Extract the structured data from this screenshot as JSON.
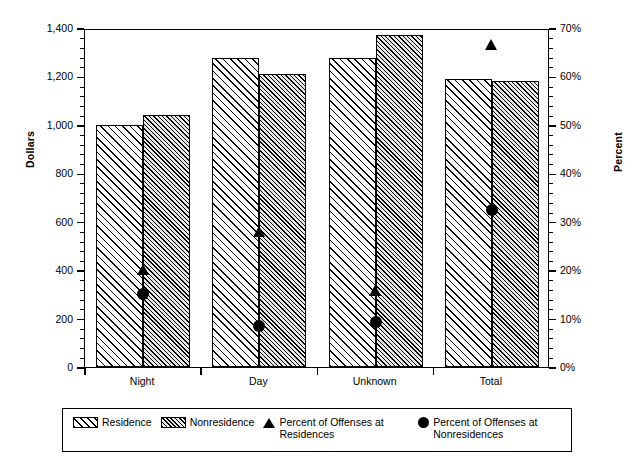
{
  "chart_data": {
    "type": "bar",
    "title": "",
    "subtitle": "",
    "xlabel": "",
    "ylabel": "Dollars",
    "y2label": "Percent",
    "categories": [
      "Night",
      "Day",
      "Unknown",
      "Total"
    ],
    "ylim": [
      0,
      1400
    ],
    "y2lim": [
      0,
      70
    ],
    "yticks": [
      0,
      200,
      400,
      600,
      800,
      1000,
      1200,
      1400
    ],
    "ytick_labels": [
      "0",
      "200",
      "400",
      "600",
      "800",
      "1,000",
      "1,200",
      "1,400"
    ],
    "y2ticks": [
      0,
      10,
      20,
      30,
      40,
      50,
      60,
      70
    ],
    "y2tick_labels": [
      "0%",
      "10%",
      "20%",
      "30%",
      "40%",
      "50%",
      "60%",
      "70%"
    ],
    "grid": false,
    "legend_position": "bottom",
    "series": [
      {
        "name": "Residence",
        "type": "bar",
        "axis": "left",
        "unit": "dollars",
        "fill": "diagonal-hatch-wide",
        "values": [
          1000,
          1275,
          1275,
          1190
        ]
      },
      {
        "name": "Nonresidence",
        "type": "bar",
        "axis": "left",
        "unit": "dollars",
        "fill": "diagonal-hatch-dense",
        "values": [
          1040,
          1210,
          1370,
          1180
        ]
      },
      {
        "name": "Percent of Offenses at Residences",
        "type": "scatter",
        "axis": "right",
        "unit": "percent",
        "marker": "triangle",
        "values": [
          20.5,
          28.3,
          16.3,
          67.0
        ]
      },
      {
        "name": "Percent of Offenses at Nonresidences",
        "type": "scatter",
        "axis": "right",
        "unit": "percent",
        "marker": "circle",
        "values": [
          15.5,
          8.9,
          9.7,
          32.8
        ]
      }
    ]
  },
  "legend": {
    "items": [
      {
        "label": "Residence",
        "icon": "hatch-swatch-residence"
      },
      {
        "label": "Nonresidence",
        "icon": "hatch-swatch-nonresidence"
      },
      {
        "label": "Percent of Offenses at Residences",
        "icon": "triangle-marker"
      },
      {
        "label": "Percent of Offenses at Nonresidences",
        "icon": "circle-marker"
      }
    ]
  },
  "colors": {
    "ink": "#000000",
    "background": "#ffffff",
    "nonresidence_fill": "#e8e8e8"
  }
}
